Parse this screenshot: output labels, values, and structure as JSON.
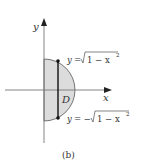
{
  "figure": {
    "caption": "(b)",
    "region_label": "D",
    "axes": {
      "x_label": "x",
      "y_label": "y"
    },
    "upper_curve": {
      "lhs": "y",
      "eq": "=",
      "rhs_radicand": "1 − x",
      "exp": "2"
    },
    "lower_curve": {
      "lhs": "y",
      "eq": "= −",
      "rhs_radicand": "1 − x",
      "exp": "2"
    },
    "colors": {
      "fill": "#dcdcdc",
      "stroke": "#555555",
      "axis": "#666666",
      "chord": "#111111"
    }
  }
}
